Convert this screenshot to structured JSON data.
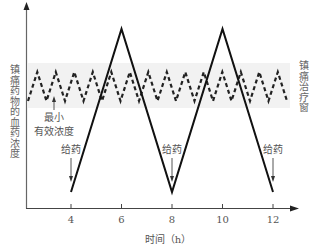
{
  "chart_data": {
    "type": "line",
    "title": "",
    "xlabel": "时间（h）",
    "ylabel": "镇痛药物的血药浓度",
    "right_label": "镇痛治疗窗",
    "x_ticks": [
      4,
      6,
      8,
      10,
      12
    ],
    "x_tick_labels": [
      "4",
      "6",
      "8",
      "10",
      "12"
    ],
    "xlim": [
      2,
      13
    ],
    "y_ticks": [],
    "grid": false,
    "legend": null,
    "series": [
      {
        "name": "按时给药（持续小剂量）",
        "style": "dashed",
        "shape": "zigzag",
        "x_start": 2.2,
        "x_end": 12.6,
        "period_h": 0.73,
        "peak_level": "within therapeutic window (upper)",
        "trough_level": "just above minimum effective concentration",
        "relative_peak": 0.78,
        "relative_trough": 0.6
      },
      {
        "name": "按需大剂量给药",
        "style": "solid",
        "shape": "triangle",
        "x": [
          4,
          6,
          8,
          10,
          12
        ],
        "relative_y": [
          0.09,
          1.0,
          0.09,
          1.0,
          0.09
        ]
      }
    ],
    "therapeutic_window": {
      "relative_low": 0.56,
      "relative_high": 0.82
    },
    "annotations": [
      {
        "text": "给药",
        "x": 4,
        "type": "arrow-down"
      },
      {
        "text": "给药",
        "x": 8,
        "type": "arrow-down"
      },
      {
        "text": "给药",
        "x": 12,
        "type": "arrow-down"
      },
      {
        "text": "最小",
        "text2": "有效浓度",
        "x": 3.1,
        "type": "arrow-up"
      }
    ]
  },
  "labels": {
    "ylabel": "镇痛药物的血药浓度",
    "right_label": "镇痛治疗窗",
    "xlabel": "时间（h）",
    "ticks": [
      "4",
      "6",
      "8",
      "10",
      "12"
    ],
    "dose1": "给药",
    "dose2": "给药",
    "dose3": "给药",
    "mec_line1": "最小",
    "mec_line2": "有效浓度"
  }
}
